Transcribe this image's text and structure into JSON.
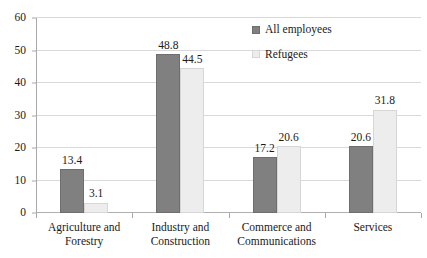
{
  "chart_data": {
    "type": "bar",
    "title": "",
    "subtitle": "",
    "xlabel": "",
    "ylabel": "",
    "ylim": [
      0,
      60
    ],
    "yticks": [
      0,
      10,
      20,
      30,
      40,
      50,
      60
    ],
    "grid": true,
    "legend_position": "top-right",
    "categories": [
      "Agriculture and Forestry",
      "Industry and Construction",
      "Commerce and Communications",
      "Services"
    ],
    "category_lines": [
      [
        "Agriculture and",
        "Forestry"
      ],
      [
        "Industry and",
        "Construction"
      ],
      [
        "Commerce and",
        "Communications"
      ],
      [
        "Services"
      ]
    ],
    "series": [
      {
        "name": "All employees",
        "color": "#808080",
        "values": [
          13.4,
          48.8,
          17.2,
          20.6
        ],
        "labels": [
          "13.4",
          "48.8",
          "17.2",
          "20.6"
        ]
      },
      {
        "name": "Refugees",
        "color": "#ededed",
        "values": [
          3.1,
          44.5,
          20.6,
          31.8
        ],
        "labels": [
          "3.1",
          "44.5",
          "20.6",
          "31.8"
        ]
      }
    ]
  },
  "axis": {
    "y_tick_labels": [
      "60",
      "50",
      "40",
      "30",
      "20",
      "10",
      "0"
    ]
  },
  "legend": {
    "items": [
      {
        "label": "All employees",
        "swatch": "legend-swatch-dark"
      },
      {
        "label": "Refugees",
        "swatch": "legend-swatch-light"
      }
    ]
  }
}
